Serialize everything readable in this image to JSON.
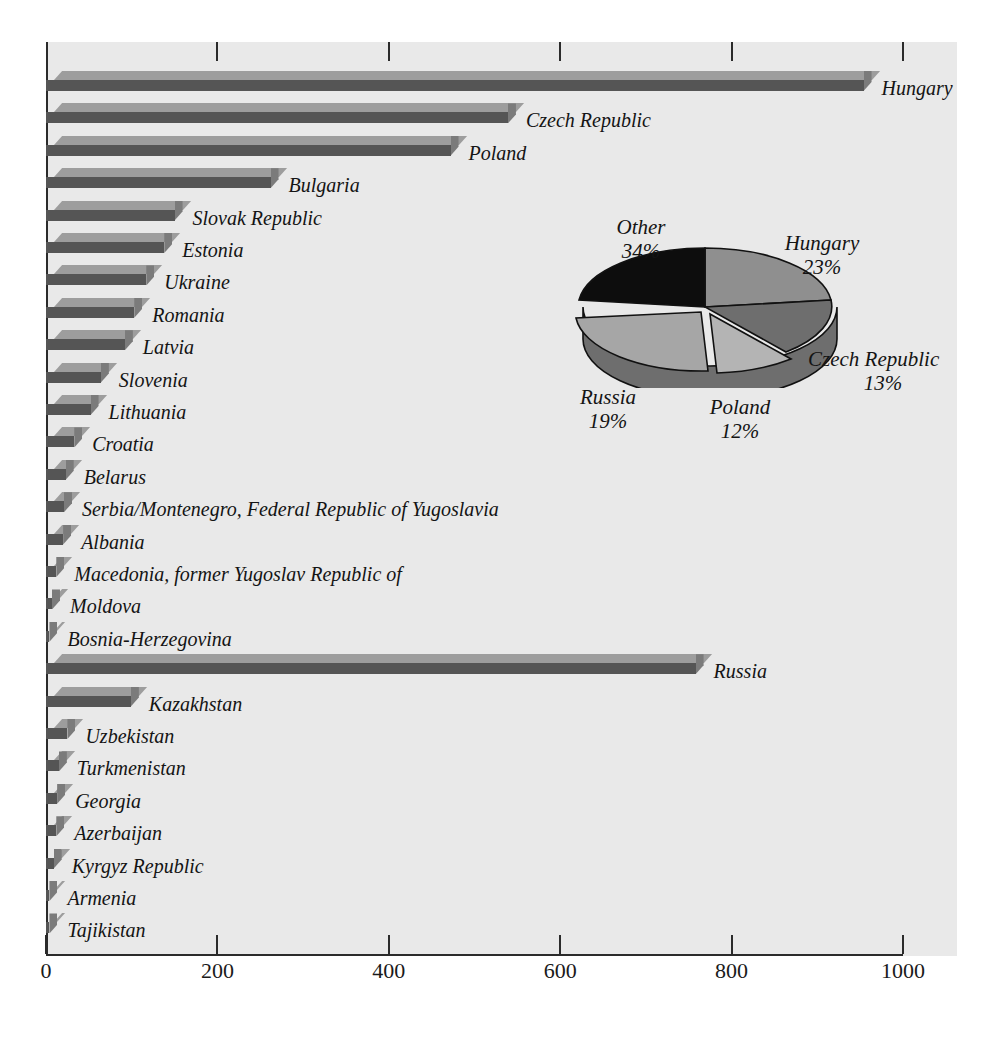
{
  "chart_data": {
    "type": "bar",
    "title": "",
    "xlabel": "",
    "ylabel": "",
    "orientation": "horizontal",
    "xlim": [
      0,
      1000
    ],
    "xticks": [
      0,
      200,
      400,
      600,
      800,
      1000
    ],
    "xtick_labels": [
      "0",
      "200",
      "400",
      "600",
      "800",
      "1000"
    ],
    "grid": false,
    "legend": "none",
    "categories": [
      "Hungary",
      "Czech Republic",
      "Poland",
      "Bulgaria",
      "Slovak Republic",
      "Estonia",
      "Ukraine",
      "Romania",
      "Latvia",
      "Slovenia",
      "Lithuania",
      "Croatia",
      "Belarus",
      "Serbia/Montenegro, Federal Republic of Yugoslavia",
      "Albania",
      "Macedonia, former Yugoslav Republic of",
      "Moldova",
      "Bosnia-Herzegovina",
      "Russia",
      "Kazakhstan",
      "Uzbekistan",
      "Turkmenistan",
      "Georgia",
      "Azerbaijan",
      "Kyrgyz Republic",
      "Armenia",
      "Tajikistan"
    ],
    "values": [
      954,
      539,
      472,
      262,
      150,
      138,
      117,
      103,
      92,
      64,
      52,
      33,
      23,
      21,
      20,
      12,
      7,
      4,
      758,
      99,
      25,
      15,
      13,
      12,
      9,
      4,
      4
    ]
  },
  "pie_data": {
    "type": "pie",
    "title": "",
    "labels": [
      "Hungary",
      "Czech Republic",
      "Poland",
      "Russia",
      "Other"
    ],
    "values": [
      23,
      13,
      12,
      19,
      34
    ],
    "value_suffix": "%",
    "slice_labels": [
      {
        "name": "Hungary",
        "pct": "23%"
      },
      {
        "name": "Czech Republic",
        "pct": "13%"
      },
      {
        "name": "Poland",
        "pct": "12%"
      },
      {
        "name": "Russia",
        "pct": "19%"
      },
      {
        "name": "Other",
        "pct": "34%"
      }
    ]
  },
  "colors": {
    "plot_background": "#e9e9e9",
    "page_background": "#ffffff",
    "bar_top_face": "#9d9d9d",
    "bar_front_face": "#555555",
    "bar_side_face": "#7b7b7b",
    "axis": "#2b2b2b",
    "text": "#141414",
    "pie_hungary": "#8f8f8f",
    "pie_czech": "#6e6e6e",
    "pie_poland": "#b4b4b4",
    "pie_russia": "#a6a6a6",
    "pie_other": "#0d0d0d"
  }
}
